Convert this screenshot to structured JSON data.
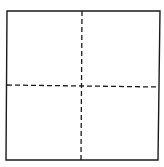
{
  "diagram": {
    "type": "square-divided-into-quadrants",
    "stroke_color": "#1a1a1a",
    "square": {
      "x1": 7,
      "y1": 11,
      "x2": 160,
      "y2": 11,
      "x3": 158,
      "y3": 160,
      "x4": 6,
      "y4": 160
    },
    "vertical_divider": {
      "style": "dashed",
      "x_top": 82,
      "y_top": 11,
      "x_bottom": 81,
      "y_bottom": 160
    },
    "horizontal_divider": {
      "style": "dashed",
      "x_left": 7,
      "y_left": 85,
      "x_right": 159,
      "y_right": 87
    },
    "dash_pattern": "5 3",
    "quadrants": 4
  }
}
